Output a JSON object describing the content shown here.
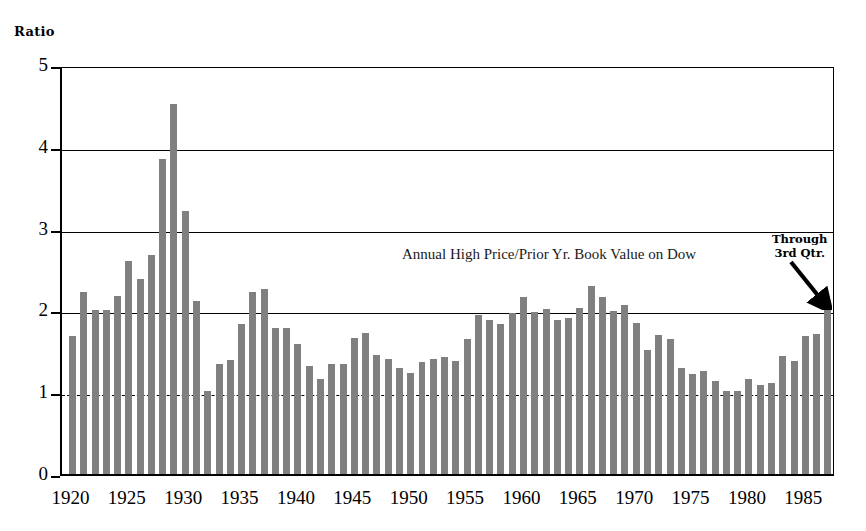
{
  "axis_caption": "Ratio",
  "annotation": {
    "line1": "Through",
    "line2": "3rd Qtr.",
    "arrow_icon": "arrow-down-right-icon"
  },
  "colors": {
    "bar": "#808080",
    "axis": "#000000",
    "grid": "#000000",
    "background": "#ffffff"
  },
  "chart_data": {
    "type": "bar",
    "title": "Annual High Price/Prior Yr. Book Value on Dow",
    "xlabel": "",
    "ylabel": "Ratio",
    "ylim": [
      0,
      5
    ],
    "yticks": [
      0,
      1,
      2,
      3,
      4,
      5
    ],
    "ytick_labels": [
      "0",
      "1",
      "2",
      "3",
      "4",
      "5"
    ],
    "gridlines": [
      {
        "value": 1,
        "style": "dashed"
      },
      {
        "value": 2,
        "style": "solid"
      },
      {
        "value": 3,
        "style": "solid"
      },
      {
        "value": 4,
        "style": "solid"
      }
    ],
    "xticks": [
      1920,
      1925,
      1930,
      1935,
      1940,
      1945,
      1950,
      1955,
      1960,
      1965,
      1970,
      1975,
      1980,
      1985
    ],
    "xtick_labels": [
      "1920",
      "1925",
      "1930",
      "1935",
      "1940",
      "1945",
      "1950",
      "1955",
      "1960",
      "1965",
      "1970",
      "1975",
      "1980",
      "1985"
    ],
    "xlim": [
      1919.4,
      1987.8
    ],
    "legend": null,
    "grid": true,
    "annotations": [
      {
        "text": "Through 3rd Qtr.",
        "points_to_year": 1987,
        "points_to_value": 2.0
      }
    ],
    "categories": [
      1920,
      1921,
      1922,
      1923,
      1924,
      1925,
      1926,
      1927,
      1928,
      1929,
      1930,
      1931,
      1932,
      1933,
      1934,
      1935,
      1936,
      1937,
      1938,
      1939,
      1940,
      1941,
      1942,
      1943,
      1944,
      1945,
      1946,
      1947,
      1948,
      1949,
      1950,
      1951,
      1952,
      1953,
      1954,
      1955,
      1956,
      1957,
      1958,
      1959,
      1960,
      1961,
      1962,
      1963,
      1964,
      1965,
      1966,
      1967,
      1968,
      1969,
      1970,
      1971,
      1972,
      1973,
      1974,
      1975,
      1976,
      1977,
      1978,
      1979,
      1980,
      1981,
      1982,
      1983,
      1984,
      1985,
      1986,
      1987
    ],
    "values": [
      1.69,
      2.22,
      2.0,
      2.0,
      2.18,
      2.6,
      2.38,
      2.68,
      3.85,
      4.52,
      3.22,
      2.11,
      1.01,
      1.34,
      1.39,
      1.83,
      2.22,
      2.26,
      1.79,
      1.78,
      1.59,
      1.32,
      1.16,
      1.34,
      1.35,
      1.66,
      1.73,
      1.46,
      1.41,
      1.29,
      1.24,
      1.37,
      1.41,
      1.43,
      1.38,
      1.65,
      1.95,
      1.88,
      1.83,
      1.97,
      2.16,
      1.98,
      2.02,
      1.88,
      1.91,
      2.03,
      2.3,
      2.17,
      1.99,
      2.07,
      1.85,
      1.51,
      1.7,
      1.65,
      1.29,
      1.22,
      1.26,
      1.14,
      1.02,
      1.01,
      1.16,
      1.09,
      1.11,
      1.44,
      1.38,
      1.69,
      1.71,
      2.0
    ]
  }
}
